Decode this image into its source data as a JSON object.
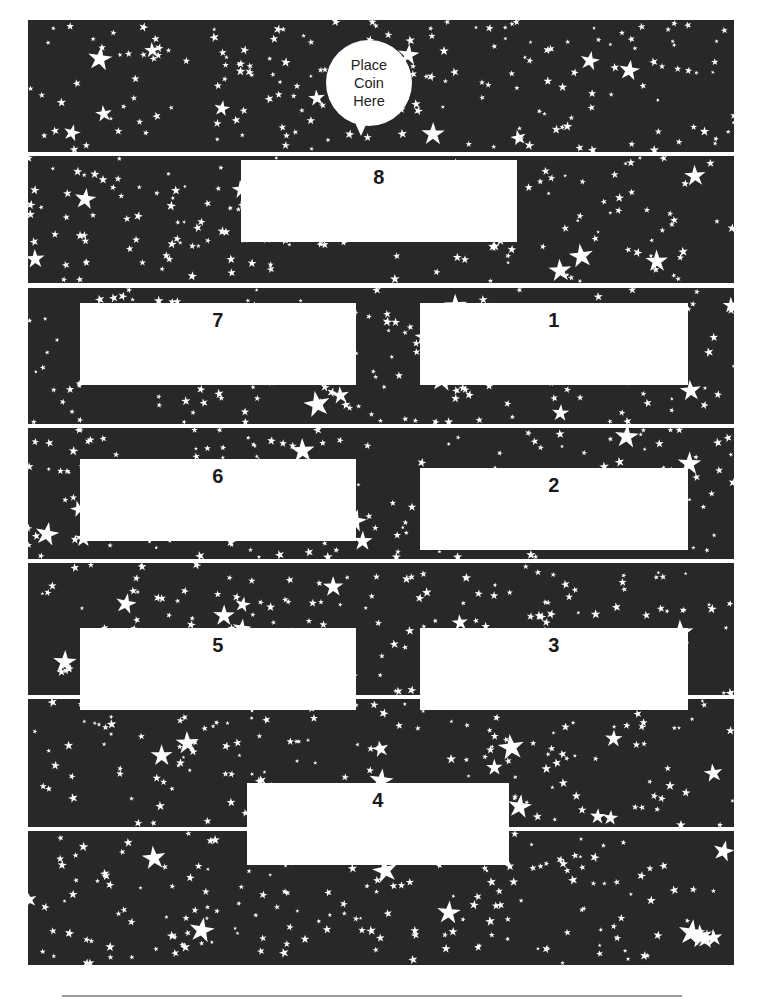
{
  "page": {
    "background_color": "#ffffff",
    "starfield_color": "#282828",
    "star_color": "#ffffff",
    "box_color": "#ffffff",
    "number_color": "#1a1a1a",
    "footer_rule_color": "#9a9ca0",
    "width": 760,
    "height": 1008
  },
  "balloon": {
    "name": "place-coin-here-balloon",
    "line1": "Place",
    "line2": "Coin",
    "line3": "Here"
  },
  "slots": [
    {
      "id": "slot-8",
      "label": "8",
      "column": "center",
      "x": 241,
      "y": 160,
      "w": 276,
      "h": 82
    },
    {
      "id": "slot-7",
      "label": "7",
      "column": "left",
      "x": 80,
      "y": 303,
      "w": 276,
      "h": 82
    },
    {
      "id": "slot-1",
      "label": "1",
      "column": "right",
      "x": 420,
      "y": 303,
      "w": 268,
      "h": 82
    },
    {
      "id": "slot-6",
      "label": "6",
      "column": "left",
      "x": 80,
      "y": 459,
      "w": 276,
      "h": 82
    },
    {
      "id": "slot-2",
      "label": "2",
      "column": "right",
      "x": 420,
      "y": 468,
      "w": 268,
      "h": 82
    },
    {
      "id": "slot-5",
      "label": "5",
      "column": "left",
      "x": 80,
      "y": 628,
      "w": 276,
      "h": 82
    },
    {
      "id": "slot-3",
      "label": "3",
      "column": "right",
      "x": 420,
      "y": 628,
      "w": 268,
      "h": 82
    },
    {
      "id": "slot-4",
      "label": "4",
      "column": "center",
      "x": 247,
      "y": 783,
      "w": 262,
      "h": 82
    }
  ],
  "bands": [
    {
      "id": "band-1",
      "y": 20,
      "h": 132
    },
    {
      "id": "band-2",
      "y": 156,
      "h": 127
    },
    {
      "id": "band-3",
      "y": 288,
      "h": 136
    },
    {
      "id": "band-4",
      "y": 428,
      "h": 131
    },
    {
      "id": "band-5",
      "y": 563,
      "h": 132
    },
    {
      "id": "band-6",
      "y": 699,
      "h": 128
    },
    {
      "id": "band-7",
      "y": 831,
      "h": 134
    }
  ]
}
